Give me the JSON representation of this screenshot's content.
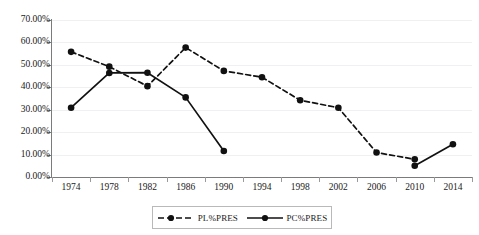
{
  "chart_data": {
    "type": "line",
    "title": "",
    "subtitle": "",
    "xlabel": "",
    "ylabel": "",
    "categories": [
      "1974",
      "1978",
      "1982",
      "1986",
      "1990",
      "1994",
      "1998",
      "2002",
      "2006",
      "2010",
      "2014"
    ],
    "ylim": [
      0,
      70
    ],
    "ytick_labels": [
      "0.00%",
      "10.00%",
      "20.00%",
      "30.00%",
      "40.00%",
      "50.00%",
      "60.00%",
      "70.00%"
    ],
    "ytick_values": [
      0,
      10,
      20,
      30,
      40,
      50,
      60,
      70
    ],
    "grid": true,
    "legend_position": "bottom",
    "series": [
      {
        "name": "PL%PRES",
        "style": "dashed",
        "marker": "circle",
        "color": "#111111",
        "x": [
          "1974",
          "1978",
          "1982",
          "1986",
          "1990",
          "1994",
          "1998",
          "2002",
          "2006",
          "2010"
        ],
        "values": [
          55.8,
          49.2,
          40.5,
          57.7,
          47.3,
          44.5,
          34.2,
          30.9,
          10.9,
          7.9
        ]
      },
      {
        "name": "PC%PRES",
        "style": "solid",
        "marker": "circle",
        "color": "#111111",
        "x": [
          "1974",
          "1978",
          "1982",
          "1986",
          "1990",
          "2010",
          "2014"
        ],
        "values": [
          30.9,
          46.4,
          46.5,
          35.5,
          11.6,
          5.0,
          14.6
        ],
        "segments": [
          [
            "1974",
            "1978",
            "1982",
            "1986",
            "1990"
          ],
          [
            "2010",
            "2014"
          ]
        ]
      }
    ]
  },
  "legend": {
    "entries": [
      {
        "label": "PL%PRES",
        "style": "dashed"
      },
      {
        "label": "PC%PRES",
        "style": "solid"
      }
    ]
  }
}
